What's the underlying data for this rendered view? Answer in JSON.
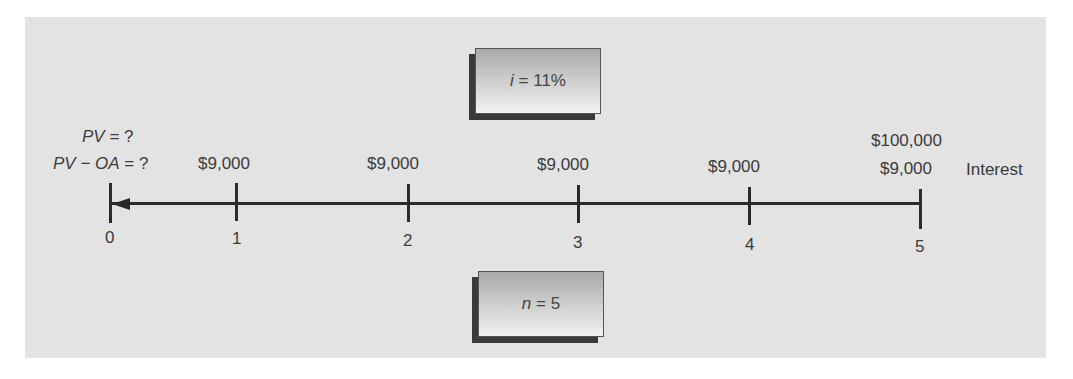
{
  "parameters": {
    "interest_rate": {
      "var": "i",
      "eq": " = ",
      "value": "11%"
    },
    "periods": {
      "var": "n",
      "eq": " = ",
      "value": "5"
    }
  },
  "unknowns": {
    "pv": {
      "var": "PV",
      "eq": " = ?"
    },
    "pv_oa": {
      "var_a": "PV",
      "minus": " − ",
      "var_b": "OA",
      "eq": " = ?"
    }
  },
  "timeline": {
    "ticks": [
      "0",
      "1",
      "2",
      "3",
      "4",
      "5"
    ],
    "cash_flows": [
      "",
      "$9,000",
      "$9,000",
      "$9,000",
      "$9,000",
      "$9,000"
    ],
    "principal_at_end": "$100,000",
    "interest_label": "Interest"
  },
  "colors": {
    "panel": "#e3e3e3",
    "line": "#2b2b2b",
    "text": "#3b3b3b"
  }
}
